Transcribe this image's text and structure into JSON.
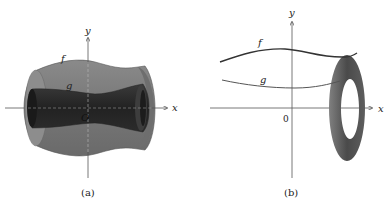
{
  "figure_a": {
    "caption": "(a)",
    "x_axis_label": "x",
    "y_axis_label": "y",
    "origin_label": "O",
    "outer_curve_label": "f",
    "inner_curve_label": "g",
    "description": "Solid of revolution with a hollow core (washer method)"
  },
  "figure_b": {
    "caption": "(b)",
    "x_axis_label": "x",
    "y_axis_label": "y",
    "origin_label": "0",
    "upper_curve_label": "f",
    "lower_curve_label": "g",
    "description": "Curves f and g with a washer cross-section"
  },
  "colors": {
    "outer_solid": "#7a7a7a",
    "inner_tube": "#2e2e2e",
    "washer": "#5a5a5a",
    "axis": "#555555"
  }
}
